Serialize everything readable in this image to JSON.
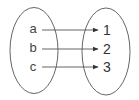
{
  "diagram": {
    "type": "mapping",
    "domain_set": {
      "elements": [
        "a",
        "b",
        "c"
      ]
    },
    "codomain_set": {
      "elements": [
        "1",
        "2",
        "3"
      ]
    },
    "mappings": [
      {
        "from": "a",
        "to": "1"
      },
      {
        "from": "b",
        "to": "2"
      },
      {
        "from": "c",
        "to": "3"
      }
    ],
    "colors": {
      "stroke": "#555555",
      "arrow": "#444444",
      "text": "#333333"
    }
  }
}
